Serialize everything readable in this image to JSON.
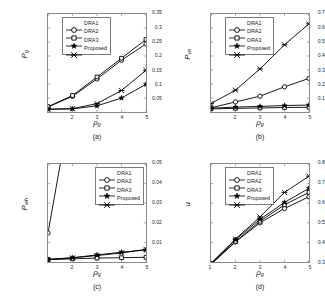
{
  "figure": {
    "series_names": [
      "DRA1",
      "DRA2",
      "DRA3",
      "Proposed"
    ],
    "x_label": "ρ",
    "x_label_sub": "g",
    "axis_color": "#8a8a8a",
    "line_color": "#000000"
  },
  "panels": [
    {
      "id": "a",
      "caption": "(a)",
      "ylabel": "P",
      "ylabel_sub": "g",
      "legend_pos": "upper-left"
    },
    {
      "id": "b",
      "caption": "(b)",
      "ylabel": "P",
      "ylabel_sub": "vn",
      "legend_pos": "upper-left"
    },
    {
      "id": "c",
      "caption": "(c)",
      "ylabel": "P",
      "ylabel_sub": "wh",
      "legend_pos": "upper-right"
    },
    {
      "id": "d",
      "caption": "(d)",
      "ylabel": "u",
      "ylabel_sub": "",
      "legend_pos": "upper-left"
    }
  ],
  "chart_data": [
    {
      "type": "line",
      "panel": "a",
      "title": "",
      "xlabel": "ρ_g",
      "ylabel": "P_g",
      "x": [
        1,
        2,
        3,
        4,
        5
      ],
      "xlim": [
        1,
        5
      ],
      "ylim": [
        0,
        0.35
      ],
      "xticks": [
        1,
        2,
        3,
        4,
        5
      ],
      "xticklabels": [
        "",
        "2",
        "3",
        "4",
        "5"
      ],
      "yticks": [
        0.05,
        0.1,
        0.15,
        0.2,
        0.25,
        0.3,
        0.35
      ],
      "yticklabels": [
        "0.05",
        "0.1",
        "0.15",
        "0.2",
        "0.25",
        "0.3",
        "0.35"
      ],
      "grid": false,
      "legend": [
        "DRA1",
        "DRA2",
        "DRA3",
        "Proposed"
      ],
      "legend_position": "upper left",
      "series": [
        {
          "name": "DRA1",
          "marker": "circle",
          "values": [
            0.018,
            0.056,
            0.118,
            0.185,
            0.243
          ]
        },
        {
          "name": "DRA2",
          "marker": "square",
          "values": [
            0.019,
            0.059,
            0.125,
            0.192,
            0.259
          ]
        },
        {
          "name": "DRA3",
          "marker": "star",
          "values": [
            0.01,
            0.011,
            0.022,
            0.05,
            0.099
          ]
        },
        {
          "name": "Proposed",
          "marker": "x",
          "values": [
            0.01,
            0.012,
            0.03,
            0.077,
            0.149
          ]
        }
      ]
    },
    {
      "type": "line",
      "panel": "b",
      "title": "",
      "xlabel": "ρ_g",
      "ylabel": "P_vn",
      "x": [
        1,
        2,
        3,
        4,
        5
      ],
      "xlim": [
        1,
        5
      ],
      "ylim": [
        0,
        0.7
      ],
      "xticks": [
        1,
        2,
        3,
        4,
        5
      ],
      "xticklabels": [
        "",
        "2",
        "3",
        "4",
        "5"
      ],
      "yticks": [
        0.1,
        0.2,
        0.3,
        0.4,
        0.5,
        0.6,
        0.7
      ],
      "yticklabels": [
        "0.1",
        "0.2",
        "0.3",
        "0.4",
        "0.5",
        "0.6",
        "0.7"
      ],
      "grid": false,
      "legend": [
        "DRA1",
        "DRA2",
        "DRA3",
        "Proposed"
      ],
      "legend_position": "upper left",
      "series": [
        {
          "name": "DRA1",
          "marker": "circle",
          "values": [
            0.03,
            0.072,
            0.113,
            0.18,
            0.24
          ]
        },
        {
          "name": "DRA2",
          "marker": "square",
          "values": [
            0.022,
            0.026,
            0.029,
            0.032,
            0.034
          ]
        },
        {
          "name": "DRA3",
          "marker": "star",
          "values": [
            0.027,
            0.035,
            0.04,
            0.046,
            0.05
          ]
        },
        {
          "name": "Proposed",
          "marker": "x",
          "values": [
            0.06,
            0.156,
            0.308,
            0.48,
            0.63
          ]
        }
      ]
    },
    {
      "type": "line",
      "panel": "c",
      "title": "",
      "xlabel": "ρ_g",
      "ylabel": "P_wh",
      "x": [
        1,
        2,
        3,
        4,
        5
      ],
      "xlim": [
        1,
        5
      ],
      "ylim": [
        0,
        0.05
      ],
      "xticks": [
        1,
        2,
        3,
        4,
        5
      ],
      "xticklabels": [
        "",
        "2",
        "3",
        "4",
        "5"
      ],
      "yticks": [
        0.01,
        0.02,
        0.03,
        0.04,
        0.05
      ],
      "yticklabels": [
        "0.01",
        "0.02",
        "0.03",
        "0.04",
        "0.05"
      ],
      "grid": false,
      "legend": [
        "DRA1",
        "DRA2",
        "DRA3",
        "Proposed"
      ],
      "legend_position": "upper right",
      "note": "DRA1 rises off the top of the axis after x=1",
      "series": [
        {
          "name": "DRA1",
          "marker": "circle",
          "values": [
            0.0148,
            0.085,
            null,
            null,
            null
          ]
        },
        {
          "name": "DRA2",
          "marker": "square",
          "values": [
            0.0012,
            0.0016,
            0.002,
            0.0022,
            0.0024
          ]
        },
        {
          "name": "DRA3",
          "marker": "star",
          "values": [
            0.0013,
            0.0022,
            0.0036,
            0.005,
            0.0061
          ]
        },
        {
          "name": "Proposed",
          "marker": "x",
          "values": [
            0.0013,
            0.0021,
            0.0033,
            0.0046,
            0.0065
          ]
        }
      ]
    },
    {
      "type": "line",
      "panel": "d",
      "title": "",
      "xlabel": "ρ_g",
      "ylabel": "u",
      "x": [
        1,
        2,
        3,
        4,
        5
      ],
      "xlim": [
        1,
        5
      ],
      "ylim": [
        0.3,
        0.8
      ],
      "xticks": [
        1,
        2,
        3,
        4,
        5
      ],
      "xticklabels": [
        "1",
        "2",
        "3",
        "4",
        "5"
      ],
      "yticks": [
        0.3,
        0.4,
        0.5,
        0.6,
        0.7,
        0.8
      ],
      "yticklabels": [
        "0.3",
        "0.4",
        "0.5",
        "0.6",
        "0.7",
        "0.8"
      ],
      "grid": false,
      "legend": [
        "DRA1",
        "DRA2",
        "DRA3",
        "Proposed"
      ],
      "legend_position": "upper left",
      "series": [
        {
          "name": "DRA1",
          "marker": "circle",
          "values": [
            0.288,
            0.402,
            0.5,
            0.573,
            0.633
          ]
        },
        {
          "name": "DRA2",
          "marker": "square",
          "values": [
            0.29,
            0.405,
            0.508,
            0.592,
            0.655
          ]
        },
        {
          "name": "DRA3",
          "marker": "star",
          "values": [
            0.292,
            0.414,
            0.518,
            0.604,
            0.676
          ]
        },
        {
          "name": "Proposed",
          "marker": "x",
          "values": [
            0.293,
            0.417,
            0.53,
            0.655,
            0.738
          ]
        }
      ]
    }
  ]
}
